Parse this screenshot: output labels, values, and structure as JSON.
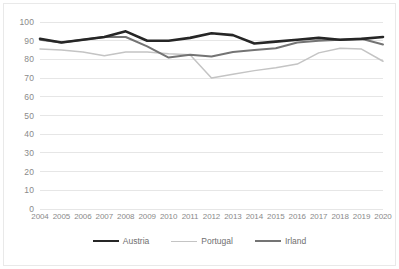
{
  "chart_data": {
    "type": "line",
    "title": "",
    "subtitle": "",
    "xlabel": "",
    "ylabel": "",
    "ylim": [
      0,
      100
    ],
    "ytick_step": 10,
    "yticks": [
      100,
      90,
      80,
      70,
      60,
      50,
      40,
      30,
      20,
      10,
      0
    ],
    "grid": true,
    "grid_axis": "y",
    "legend_position": "bottom",
    "x": [
      2004,
      2005,
      2006,
      2007,
      2008,
      2009,
      2010,
      2011,
      2012,
      2013,
      2014,
      2015,
      2016,
      2017,
      2018,
      2019,
      2020
    ],
    "categories": [
      "2004",
      "2005",
      "2006",
      "2007",
      "2008",
      "2009",
      "2010",
      "2011",
      "2012",
      "2013",
      "2014",
      "2015",
      "2016",
      "2017",
      "2018",
      "2019",
      "2020"
    ],
    "series": [
      {
        "name": "Austria",
        "color": "#262626",
        "width": 2.6,
        "values": [
          91.0,
          89.0,
          90.5,
          92.0,
          95.0,
          90.0,
          90.0,
          91.5,
          94.0,
          93.0,
          88.5,
          89.5,
          90.5,
          91.5,
          90.5,
          91.0,
          92.0
        ]
      },
      {
        "name": "Portugal",
        "color": "#c4c4c4",
        "width": 1.5,
        "values": [
          85.5,
          85.0,
          84.0,
          82.0,
          84.0,
          84.0,
          83.0,
          82.5,
          70.0,
          72.0,
          74.0,
          75.5,
          77.5,
          83.5,
          86.0,
          85.5,
          79.0
        ]
      },
      {
        "name": "Irland",
        "color": "#747474",
        "width": 2.0,
        "values": [
          90.5,
          89.0,
          90.5,
          92.0,
          92.0,
          87.0,
          81.0,
          82.5,
          81.5,
          84.0,
          85.0,
          86.0,
          89.0,
          90.0,
          90.5,
          91.0,
          88.0
        ]
      }
    ]
  },
  "legend": {
    "items": [
      {
        "label": "Austria"
      },
      {
        "label": "Portugal"
      },
      {
        "label": "Irland"
      }
    ]
  },
  "colors": {
    "austria": "#262626",
    "portugal": "#c4c4c4",
    "irland": "#747474",
    "gridline": "#e6e6e6",
    "axis_text": "#8a8a8a",
    "legend_text": "#6f6f6f",
    "frame": "#e9e9e9",
    "background": "#ffffff"
  }
}
